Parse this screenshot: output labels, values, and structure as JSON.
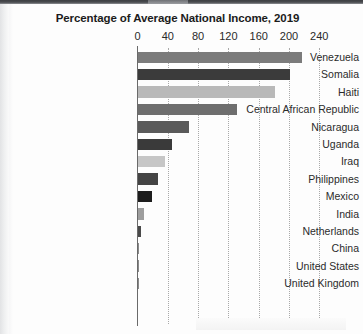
{
  "chart_data": {
    "type": "bar",
    "orientation": "horizontal",
    "title": "Percentage of Average National Income, 2019",
    "xlabel": "",
    "ylabel": "",
    "xlim": [
      0,
      240
    ],
    "xticks": [
      "0",
      "40",
      "80",
      "120",
      "160",
      "200",
      "240"
    ],
    "xtick_values": [
      0,
      40,
      80,
      120,
      160,
      200,
      240
    ],
    "grid": "vertical-dotted",
    "legend": "none",
    "categories": [
      "Venezuela",
      "Somalia",
      "Haiti",
      "Central African Republic",
      "Nicaragua",
      "Uganda",
      "Iraq",
      "Philippines",
      "Mexico",
      "India",
      "Netherlands",
      "China",
      "United States",
      "United Kingdom"
    ],
    "values": [
      217,
      201,
      181,
      132,
      68,
      45,
      36,
      27,
      19,
      9,
      4,
      1,
      1,
      0
    ],
    "bar_colors": [
      "#7b7b7b",
      "#3b3b3b",
      "#b9b9b9",
      "#6e6e6e",
      "#5a5a5a",
      "#3a3a3a",
      "#c6c6c6",
      "#444444",
      "#1d1d1d",
      "#9e9e9e",
      "#4a4a4a",
      "#8a8a8a",
      "#8a8a8a",
      "#8a8a8a"
    ]
  },
  "axis": {
    "tick_color": "#2a2a2a",
    "gridline_color": "#a9a9a9",
    "axis_color": "#6a6a6a"
  }
}
